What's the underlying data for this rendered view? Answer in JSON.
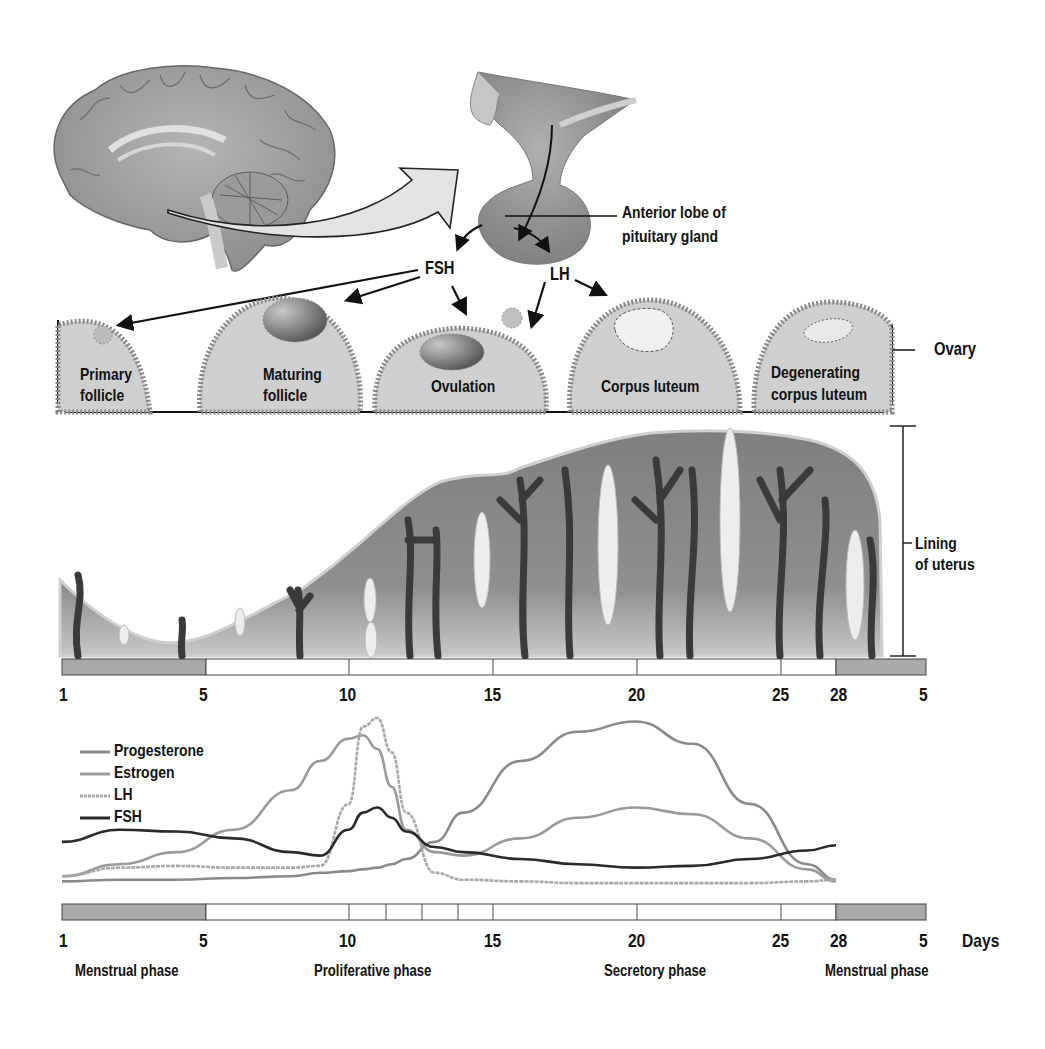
{
  "diagram": {
    "pituitary": {
      "label_line1": "Anterior lobe of",
      "label_line2": "pituitary gland"
    },
    "hormone_labels": {
      "fsh": "FSH",
      "lh": "LH"
    },
    "ovary": {
      "label": "Ovary",
      "stages": [
        {
          "line1": "Primary",
          "line2": "follicle"
        },
        {
          "line1": "Maturing",
          "line2": "follicle"
        },
        {
          "line1": "Ovulation",
          "line2": ""
        },
        {
          "line1": "Corpus luteum",
          "line2": ""
        },
        {
          "line1": "Degenerating",
          "line2": "corpus luteum"
        }
      ]
    },
    "uterus": {
      "label_line1": "Lining",
      "label_line2": "of uterus"
    },
    "day_ticks_top": [
      "1",
      "5",
      "10",
      "15",
      "20",
      "25",
      "28",
      "5"
    ],
    "day_ticks_bottom": [
      "1",
      "5",
      "10",
      "15",
      "20",
      "25",
      "28",
      "5"
    ],
    "days_label": "Days",
    "phases": [
      "Menstrual phase",
      "Proliferative phase",
      "Secretory phase",
      "Menstrual phase"
    ],
    "legend": [
      {
        "name": "Progesterone",
        "color": "#8a8a8a",
        "style": "solid"
      },
      {
        "name": "Estrogen",
        "color": "#9a9a9a",
        "style": "solid"
      },
      {
        "name": "LH",
        "color": "#a8a8a8",
        "style": "dotted"
      },
      {
        "name": "FSH",
        "color": "#2a2a2a",
        "style": "solid"
      }
    ],
    "colors": {
      "tissue": "#8c8c8c",
      "tissue_light": "#c9c9c9",
      "menstrual_bar": "#a9a9a9",
      "vessel": "#3a3a3a",
      "outline": "#222222"
    }
  },
  "chart_data": {
    "type": "line",
    "xlabel": "Days",
    "ylabel": "",
    "x": [
      1,
      3,
      5,
      7,
      9,
      10,
      11,
      11.5,
      12,
      12.5,
      13,
      14,
      15,
      17,
      19,
      21,
      23,
      25,
      27,
      28
    ],
    "series": [
      {
        "name": "Progesterone",
        "values": [
          5,
          6,
          6,
          7,
          8,
          10,
          11,
          12,
          13,
          15,
          18,
          28,
          45,
          75,
          92,
          98,
          85,
          50,
          15,
          6
        ]
      },
      {
        "name": "Estrogen",
        "values": [
          8,
          15,
          22,
          35,
          58,
          75,
          88,
          90,
          82,
          60,
          35,
          22,
          20,
          30,
          42,
          48,
          44,
          30,
          12,
          5
        ]
      },
      {
        "name": "LH",
        "values": [
          8,
          13,
          14,
          13,
          13,
          14,
          50,
          95,
          100,
          80,
          45,
          10,
          6,
          5,
          4,
          4,
          4,
          4,
          5,
          6
        ]
      },
      {
        "name": "FSH",
        "values": [
          28,
          35,
          34,
          30,
          22,
          20,
          35,
          45,
          48,
          42,
          34,
          25,
          22,
          18,
          15,
          13,
          14,
          18,
          23,
          26
        ]
      }
    ],
    "xlim": [
      1,
      28
    ],
    "grid": false,
    "legend_position": "upper-left"
  }
}
